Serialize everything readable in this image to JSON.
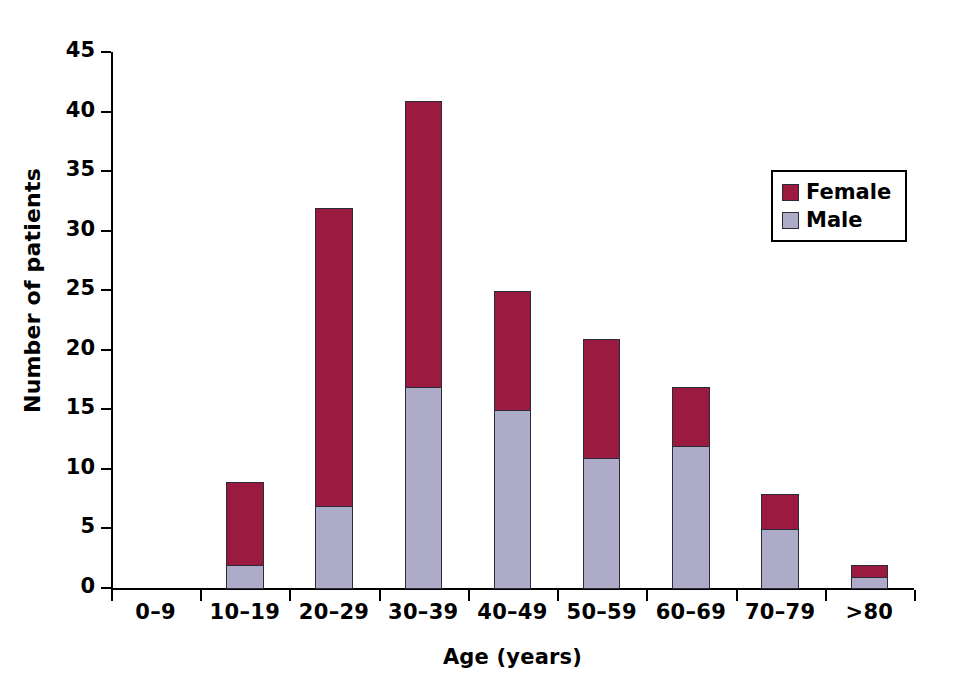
{
  "chart_data": {
    "type": "bar",
    "subtype": "stacked-vertical",
    "title": "",
    "xlabel": "Age (years)",
    "ylabel": "Number of patients",
    "categories": [
      "0–9",
      "10–19",
      "20–29",
      "30–39",
      "40–49",
      "50–59",
      "60–69",
      "70–79",
      ">80"
    ],
    "series": [
      {
        "name": "Female",
        "color": "#9b1b40",
        "values": [
          0,
          7,
          25,
          24,
          10,
          10,
          5,
          3,
          1
        ]
      },
      {
        "name": "Male",
        "color": "#aeabc9",
        "values": [
          0,
          2,
          7,
          17,
          15,
          11,
          12,
          5,
          1
        ]
      }
    ],
    "totals": [
      0,
      9,
      32,
      41,
      25,
      21,
      17,
      8,
      2
    ],
    "ylim": [
      0,
      45
    ],
    "yticks": [
      0,
      5,
      10,
      15,
      20,
      25,
      30,
      35,
      40,
      45
    ],
    "ytick_labels": [
      "0",
      "5",
      "10",
      "15",
      "20",
      "25",
      "30",
      "35",
      "40",
      "45"
    ],
    "grid": false,
    "legend_position": "top-right",
    "stack_order": [
      "Male",
      "Female"
    ]
  },
  "legend": {
    "entries": [
      {
        "label": "Female",
        "color": "#9b1b40"
      },
      {
        "label": "Male",
        "color": "#aeabc9"
      }
    ]
  }
}
